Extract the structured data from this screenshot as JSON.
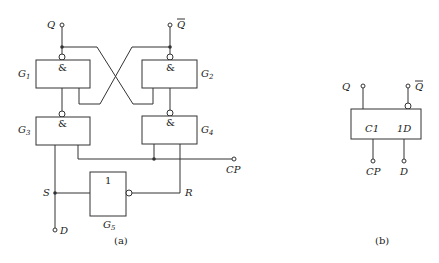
{
  "panel_a": {
    "caption": "(a)",
    "outputs": {
      "q": "Q",
      "q_bar": "Q"
    },
    "gates": [
      {
        "id": "G1",
        "name": "G",
        "sub": "1",
        "symbol": "&"
      },
      {
        "id": "G2",
        "name": "G",
        "sub": "2",
        "symbol": "&"
      },
      {
        "id": "G3",
        "name": "G",
        "sub": "3",
        "symbol": "&"
      },
      {
        "id": "G4",
        "name": "G",
        "sub": "4",
        "symbol": "&"
      },
      {
        "id": "G5",
        "name": "G",
        "sub": "5",
        "symbol": "1"
      }
    ],
    "signals": {
      "s": "S",
      "r": "R",
      "cp": "CP",
      "d": "D"
    }
  },
  "panel_b": {
    "caption": "(b)",
    "outputs": {
      "q": "Q",
      "q_bar": "Q"
    },
    "inputs": {
      "c1": "C1",
      "d1": "1D"
    },
    "terminals": {
      "cp": "CP",
      "d": "D"
    }
  }
}
